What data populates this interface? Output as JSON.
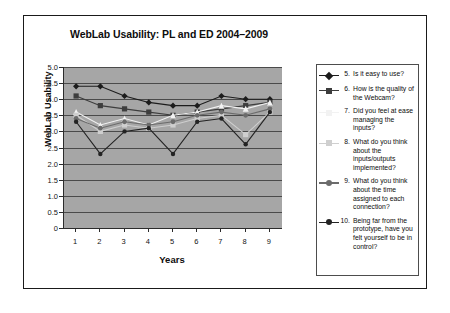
{
  "figure": {
    "title": "WebLab Usability: PL and ED 2004–2009"
  },
  "axes": {
    "ylabel": "WebLab Usability",
    "xlabel": "Years",
    "yticks": [
      "5.0",
      "4.5",
      "4.0",
      "3.5",
      "3.0",
      "2.5",
      "2.0",
      "1.5",
      "1.0",
      "0.5",
      "0"
    ],
    "xticks": [
      "1",
      "2",
      "3",
      "4",
      "5",
      "6",
      "7",
      "8",
      "9"
    ]
  },
  "legend": {
    "items": [
      {
        "number": "5.",
        "label": "Is it easy to use?",
        "color": "#1c1c1c",
        "marker": "diamond"
      },
      {
        "number": "6.",
        "label": "How is the quality of the Webcam?",
        "color": "#3d3d3d",
        "marker": "square"
      },
      {
        "number": "7.",
        "label": "Did you feel at ease managing the inputs?",
        "color": "#f2f2f2",
        "marker": "triangle"
      },
      {
        "number": "8.",
        "label": "What do you think about the inputs/outputs implemented?",
        "color": "#cfcfcf",
        "marker": "square"
      },
      {
        "number": "9.",
        "label": "What do you think about the time assigned to each connection?",
        "color": "#6b6b6b",
        "marker": "star"
      },
      {
        "number": "10.",
        "label": "Being far from the prototype, have you felt yourself to be in control?",
        "color": "#232323",
        "marker": "circle"
      }
    ]
  },
  "chart_data": {
    "type": "line",
    "title": "WebLab Usability: PL and ED 2004–2009",
    "xlabel": "Years",
    "ylabel": "WebLab Usability",
    "x": [
      1,
      2,
      3,
      4,
      5,
      6,
      7,
      8,
      9
    ],
    "xlim": [
      0.5,
      9.5
    ],
    "ylim": [
      0,
      5
    ],
    "grid": true,
    "legend_position": "right",
    "series": [
      {
        "name": "5. Is it easy to use?",
        "color": "#1c1c1c",
        "marker": "diamond",
        "values": [
          4.4,
          4.4,
          4.1,
          3.9,
          3.8,
          3.8,
          4.1,
          4.0,
          4.0
        ]
      },
      {
        "name": "6. How is the quality of the Webcam?",
        "color": "#3d3d3d",
        "marker": "square",
        "values": [
          4.1,
          3.8,
          3.7,
          3.6,
          3.5,
          3.6,
          3.7,
          3.8,
          3.9
        ]
      },
      {
        "name": "7. Did you feel at ease managing the inputs?",
        "color": "#f2f2f2",
        "marker": "triangle",
        "values": [
          3.6,
          3.2,
          3.4,
          3.2,
          3.5,
          3.6,
          3.8,
          3.7,
          3.9
        ]
      },
      {
        "name": "8. What do you think about the inputs/outputs implemented?",
        "color": "#cfcfcf",
        "marker": "square",
        "values": [
          3.5,
          3.0,
          3.2,
          3.1,
          3.2,
          3.4,
          3.5,
          2.9,
          3.6
        ]
      },
      {
        "name": "9. What do you think about the time assigned to each connection?",
        "color": "#6b6b6b",
        "marker": "star",
        "values": [
          3.4,
          3.1,
          3.3,
          3.2,
          3.3,
          3.5,
          3.6,
          3.5,
          3.7
        ]
      },
      {
        "name": "10. Being far from the prototype, have you felt yourself to be in control?",
        "color": "#232323",
        "marker": "circle",
        "values": [
          3.3,
          2.3,
          3.0,
          3.1,
          2.3,
          3.3,
          3.4,
          2.6,
          3.6
        ]
      }
    ]
  }
}
